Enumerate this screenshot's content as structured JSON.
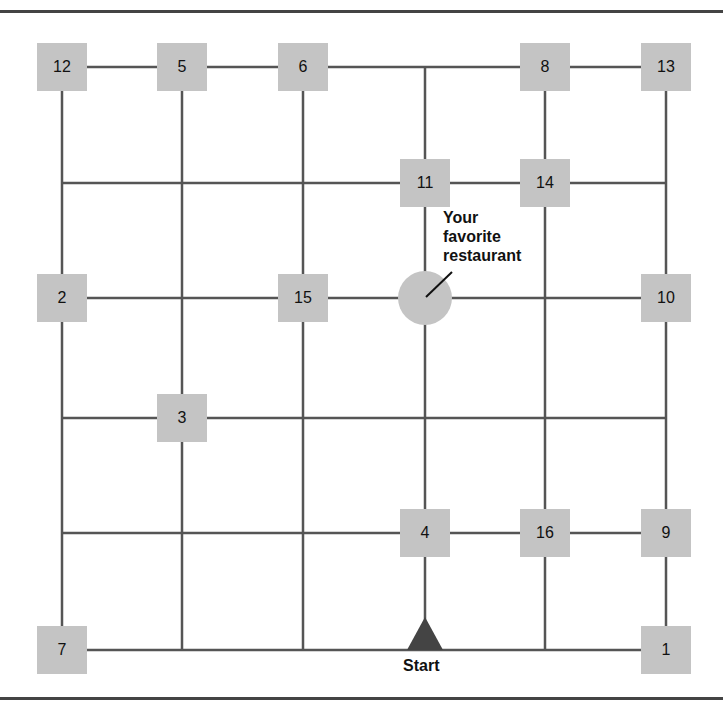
{
  "diagram": {
    "colors": {
      "line": "#555555",
      "node_fill": "#c4c4c4",
      "start_marker": "#444444",
      "frame": "#444444"
    },
    "columns_x": [
      62,
      182,
      303,
      425,
      545,
      666
    ],
    "rows_y": [
      67,
      183,
      298,
      418,
      533,
      650
    ],
    "nodes": [
      {
        "id": "12",
        "label": "12",
        "x": 62,
        "y": 67
      },
      {
        "id": "5",
        "label": "5",
        "x": 182,
        "y": 67
      },
      {
        "id": "6",
        "label": "6",
        "x": 303,
        "y": 67
      },
      {
        "id": "8",
        "label": "8",
        "x": 545,
        "y": 67
      },
      {
        "id": "13",
        "label": "13",
        "x": 666,
        "y": 67
      },
      {
        "id": "11",
        "label": "11",
        "x": 425,
        "y": 183
      },
      {
        "id": "14",
        "label": "14",
        "x": 545,
        "y": 183
      },
      {
        "id": "2",
        "label": "2",
        "x": 62,
        "y": 298
      },
      {
        "id": "15",
        "label": "15",
        "x": 303,
        "y": 298
      },
      {
        "id": "10",
        "label": "10",
        "x": 666,
        "y": 298
      },
      {
        "id": "3",
        "label": "3",
        "x": 182,
        "y": 418
      },
      {
        "id": "4",
        "label": "4",
        "x": 425,
        "y": 533
      },
      {
        "id": "16",
        "label": "16",
        "x": 545,
        "y": 533
      },
      {
        "id": "9",
        "label": "9",
        "x": 666,
        "y": 533
      },
      {
        "id": "7",
        "label": "7",
        "x": 62,
        "y": 650
      },
      {
        "id": "1",
        "label": "1",
        "x": 666,
        "y": 650
      }
    ],
    "restaurant": {
      "label_lines": [
        "Your",
        "favorite",
        "restaurant"
      ],
      "x": 425,
      "y": 298
    },
    "start": {
      "label": "Start",
      "x": 425,
      "y": 650
    }
  }
}
